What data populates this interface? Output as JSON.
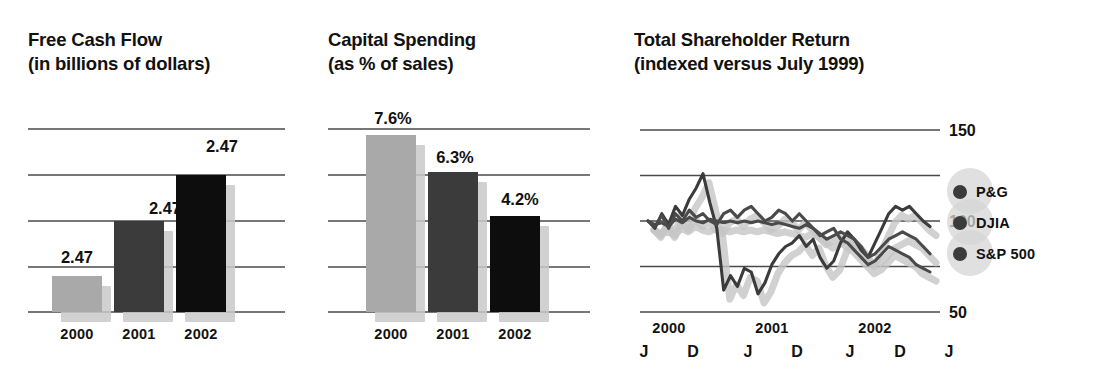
{
  "charts": [
    {
      "id": "free-cash-flow",
      "title": "Free Cash Flow",
      "subtitle": "(in billions of dollars)"
    },
    {
      "id": "capital-spending",
      "title": "Capital Spending",
      "subtitle": "(as % of sales)"
    },
    {
      "id": "total-shareholder-return",
      "title": "Total Shareholder Return",
      "subtitle": "(indexed versus July 1999)"
    }
  ],
  "legend": {
    "items": [
      {
        "label": "P&G",
        "color": "#3b3b3b"
      },
      {
        "label": "DJIA",
        "color": "#3b3b3b"
      },
      {
        "label": "S&P 500",
        "color": "#3b3b3b"
      }
    ]
  },
  "chart_data": [
    {
      "type": "bar",
      "title": "Free Cash Flow",
      "subtitle": "(in billions of dollars)",
      "xlabel": "",
      "ylabel": "",
      "categories": [
        "2000",
        "2001",
        "2002"
      ],
      "values": [
        2.47,
        2.47,
        2.47
      ],
      "data_labels": [
        "2.47",
        "2.47",
        "2.47"
      ],
      "bar_colors": [
        "#a9a9a9",
        "#3b3b3b",
        "#0d0d0d"
      ],
      "grid": true,
      "gridlines": 5,
      "legend": "none"
    },
    {
      "type": "bar",
      "title": "Capital Spending",
      "subtitle": "(as % of sales)",
      "xlabel": "",
      "ylabel": "% of sales",
      "categories": [
        "2000",
        "2001",
        "2002"
      ],
      "values": [
        7.6,
        6.3,
        4.2
      ],
      "data_labels": [
        "7.6%",
        "6.3%",
        "4.2%"
      ],
      "bar_colors": [
        "#a9a9a9",
        "#3b3b3b",
        "#0d0d0d"
      ],
      "grid": true,
      "gridlines": 5,
      "legend": "none"
    },
    {
      "type": "line",
      "title": "Total Shareholder Return",
      "subtitle": "(indexed versus July 1999)",
      "xlabel": "",
      "ylabel": "Index (July 1999 = 100)",
      "ylim": [
        50,
        150
      ],
      "yticks": [
        50,
        100,
        150
      ],
      "ytick_labels": [
        "50",
        "100",
        "150"
      ],
      "xtick_labels": [
        "J",
        "D",
        "J",
        "D",
        "J",
        "D",
        "J"
      ],
      "year_labels": [
        "2000",
        "2001",
        "2002"
      ],
      "grid": true,
      "legend": "right",
      "series": [
        {
          "name": "P&G",
          "color": "#3b3b3b",
          "values": [
            100,
            96,
            104,
            98,
            108,
            103,
            112,
            118,
            126,
            110,
            96,
            62,
            70,
            64,
            74,
            72,
            60,
            66,
            76,
            82,
            86,
            88,
            92,
            86,
            90,
            80,
            74,
            78,
            88,
            94,
            90,
            84,
            80,
            88,
            96,
            104,
            108,
            106,
            108,
            104,
            100,
            97
          ]
        },
        {
          "name": "DJIA",
          "color": "#4a4a4a",
          "values": [
            100,
            98,
            99,
            97,
            101,
            99,
            102,
            100,
            99,
            101,
            100,
            99,
            100,
            99,
            100,
            99,
            100,
            99,
            98,
            99,
            98,
            97,
            96,
            98,
            96,
            93,
            90,
            92,
            94,
            92,
            90,
            86,
            80,
            82,
            86,
            90,
            92,
            94,
            92,
            90,
            86,
            82
          ]
        },
        {
          "name": "S&P 500",
          "color": "#4a4a4a",
          "values": [
            100,
            97,
            103,
            96,
            104,
            100,
            106,
            102,
            104,
            100,
            98,
            104,
            106,
            102,
            106,
            108,
            104,
            100,
            102,
            106,
            104,
            100,
            104,
            100,
            96,
            92,
            94,
            96,
            90,
            88,
            84,
            80,
            76,
            78,
            82,
            86,
            84,
            82,
            80,
            76,
            74,
            72
          ]
        }
      ]
    }
  ]
}
